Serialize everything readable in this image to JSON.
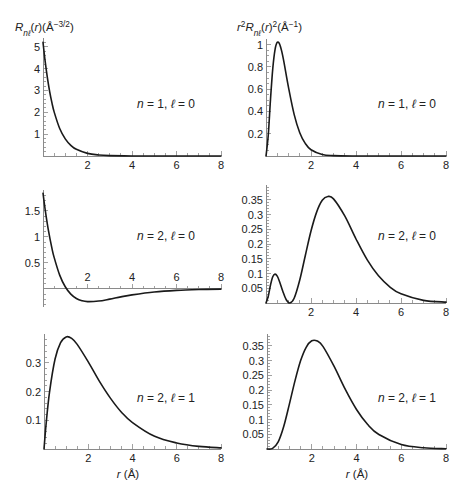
{
  "figure": {
    "left_column_ylabel": "R_nℓ(r)(Å^-3/2)",
    "right_column_ylabel": "r^2 R_nℓ(r)^2(Å^-1)",
    "xlabel": "r (Å)"
  },
  "chart_data": [
    {
      "type": "line",
      "panel": "top-left",
      "title": "",
      "ylabel": "R_nℓ(r)(Å^-3/2)",
      "ylabel_parts": [
        {
          "t": "R",
          "s": "it"
        },
        {
          "t": "nℓ",
          "s": "sub"
        },
        {
          "t": "(",
          "s": ""
        },
        {
          "t": "r",
          "s": "it"
        },
        {
          "t": ")(Å",
          "s": ""
        },
        {
          "t": "−3/2",
          "s": "sup"
        },
        {
          "t": ")",
          "s": ""
        }
      ],
      "xlabel": "",
      "annotation": "n = 1, ℓ = 0",
      "annotation_parts": [
        {
          "t": "n",
          "s": "it"
        },
        {
          "t": " = 1, ",
          "s": ""
        },
        {
          "t": "ℓ",
          "s": "it"
        },
        {
          "t": " = 0",
          "s": ""
        }
      ],
      "xlim": [
        0,
        8
      ],
      "ylim": [
        0,
        5.4
      ],
      "grid": false,
      "x_ticks": {
        "major": [
          2,
          4,
          6,
          8
        ],
        "minor_step": 0.5,
        "label_position": "below"
      },
      "y_ticks": {
        "major": [
          1,
          2,
          3,
          4,
          5
        ],
        "minor_step": 0.2
      },
      "series": [
        {
          "name": "R_10(r)",
          "x": [
            0,
            0.1,
            0.2,
            0.3,
            0.4,
            0.5,
            0.75,
            1,
            1.25,
            1.5,
            2,
            2.5,
            3,
            4,
            5,
            6,
            7,
            8
          ],
          "y": [
            5.198,
            4.303,
            3.562,
            2.948,
            2.44,
            2.02,
            1.259,
            0.785,
            0.489,
            0.305,
            0.119,
            0.046,
            0.018,
            0.003,
            0,
            0,
            0,
            0
          ]
        }
      ]
    },
    {
      "type": "line",
      "panel": "top-right",
      "title": "",
      "ylabel": "r^2 R_nℓ(r)^2(Å^-1)",
      "ylabel_parts": [
        {
          "t": "r",
          "s": "it"
        },
        {
          "t": "2",
          "s": "sup"
        },
        {
          "t": "R",
          "s": "it"
        },
        {
          "t": "nℓ",
          "s": "sub"
        },
        {
          "t": "(",
          "s": ""
        },
        {
          "t": "r",
          "s": "it"
        },
        {
          "t": ")",
          "s": ""
        },
        {
          "t": "2",
          "s": "sup"
        },
        {
          "t": "(Å",
          "s": ""
        },
        {
          "t": "−1",
          "s": "sup"
        },
        {
          "t": ")",
          "s": ""
        }
      ],
      "xlabel": "",
      "annotation": "n = 1, ℓ = 0",
      "annotation_parts": [
        {
          "t": "n",
          "s": "it"
        },
        {
          "t": " = 1, ",
          "s": ""
        },
        {
          "t": "ℓ",
          "s": "it"
        },
        {
          "t": " = 0",
          "s": ""
        }
      ],
      "xlim": [
        0,
        8
      ],
      "ylim": [
        0,
        1.05
      ],
      "grid": false,
      "x_ticks": {
        "major": [
          2,
          4,
          6,
          8
        ],
        "minor_step": 0.5,
        "label_position": "below"
      },
      "y_ticks": {
        "major": [
          0.2,
          0.4,
          0.6,
          0.8,
          1
        ],
        "minor_step": 0.05
      },
      "series": [
        {
          "name": "r^2 R_10(r)^2",
          "x": [
            0,
            0.1,
            0.2,
            0.3,
            0.4,
            0.5,
            0.6,
            0.7,
            0.8,
            1,
            1.25,
            1.5,
            1.75,
            2,
            2.5,
            3,
            4,
            5,
            6,
            7,
            8
          ],
          "y": [
            0,
            0.185,
            0.508,
            0.782,
            0.953,
            1.02,
            1.007,
            0.939,
            0.84,
            0.616,
            0.374,
            0.209,
            0.111,
            0.056,
            0.013,
            0.003,
            0,
            0,
            0,
            0,
            0
          ]
        }
      ]
    },
    {
      "type": "line",
      "panel": "middle-left",
      "title": "",
      "ylabel": "",
      "xlabel": "",
      "annotation": "n = 2, ℓ = 0",
      "annotation_parts": [
        {
          "t": "n",
          "s": "it"
        },
        {
          "t": " = 2, ",
          "s": ""
        },
        {
          "t": "ℓ",
          "s": "it"
        },
        {
          "t": " = 0",
          "s": ""
        }
      ],
      "xlim": [
        0,
        8
      ],
      "ylim": [
        -0.35,
        1.9
      ],
      "grid": false,
      "x_ticks": {
        "major": [
          2,
          4,
          6,
          8
        ],
        "minor_step": 0.5,
        "label_position": "above"
      },
      "y_ticks": {
        "major": [
          0.5,
          1,
          1.5
        ],
        "minor_step": 0.1
      },
      "series": [
        {
          "name": "R_20(r)",
          "x": [
            0,
            0.1,
            0.25,
            0.4,
            0.5,
            0.75,
            1,
            1.25,
            1.5,
            1.75,
            2,
            2.5,
            3,
            3.5,
            4,
            5,
            6,
            7,
            8
          ],
          "y": [
            1.838,
            1.514,
            1.108,
            0.783,
            0.604,
            0.263,
            0.039,
            -0.102,
            -0.186,
            -0.23,
            -0.247,
            -0.236,
            -0.198,
            -0.155,
            -0.117,
            -0.061,
            -0.03,
            -0.014,
            -0.006
          ]
        }
      ]
    },
    {
      "type": "line",
      "panel": "middle-right",
      "title": "",
      "ylabel": "",
      "xlabel": "",
      "annotation": "n = 2, ℓ = 0",
      "annotation_parts": [
        {
          "t": "n",
          "s": "it"
        },
        {
          "t": " = 2, ",
          "s": ""
        },
        {
          "t": "ℓ",
          "s": "it"
        },
        {
          "t": " = 0",
          "s": ""
        }
      ],
      "xlim": [
        0,
        8
      ],
      "ylim": [
        0,
        0.4
      ],
      "grid": false,
      "x_ticks": {
        "major": [
          2,
          4,
          6,
          8
        ],
        "minor_step": 0.5,
        "label_position": "below"
      },
      "y_ticks": {
        "major": [
          0.05,
          0.1,
          0.15,
          0.2,
          0.25,
          0.3,
          0.35
        ],
        "minor_step": 0.01
      },
      "series": [
        {
          "name": "r^2 R_20(r)^2",
          "x": [
            0,
            0.1,
            0.2,
            0.3,
            0.4,
            0.5,
            0.6,
            0.75,
            0.9,
            1.058,
            1.25,
            1.5,
            1.75,
            2,
            2.25,
            2.5,
            2.75,
            3,
            3.5,
            4,
            4.5,
            5,
            5.5,
            6,
            7,
            8
          ],
          "y": [
            0,
            0.023,
            0.061,
            0.089,
            0.098,
            0.091,
            0.073,
            0.039,
            0.011,
            0,
            0.016,
            0.078,
            0.162,
            0.244,
            0.308,
            0.348,
            0.361,
            0.353,
            0.295,
            0.217,
            0.146,
            0.092,
            0.055,
            0.031,
            0.009,
            0.003
          ]
        }
      ]
    },
    {
      "type": "line",
      "panel": "bottom-left",
      "title": "",
      "ylabel": "",
      "xlabel": "r (Å)",
      "xlabel_parts": [
        {
          "t": "r",
          "s": "it"
        },
        {
          "t": " (Å)",
          "s": ""
        }
      ],
      "annotation": "n = 2, ℓ = 1",
      "annotation_parts": [
        {
          "t": "n",
          "s": "it"
        },
        {
          "t": " = 2, ",
          "s": ""
        },
        {
          "t": "ℓ",
          "s": "it"
        },
        {
          "t": " = 1",
          "s": ""
        }
      ],
      "xlim": [
        0,
        8
      ],
      "ylim": [
        0,
        0.4
      ],
      "grid": false,
      "x_ticks": {
        "major": [
          2,
          4,
          6,
          8
        ],
        "minor_step": 0.5,
        "label_position": "below"
      },
      "y_ticks": {
        "major": [
          0.1,
          0.2,
          0.3
        ],
        "minor_step": 0.02
      },
      "series": [
        {
          "name": "R_21(r)",
          "x": [
            0,
            0.1,
            0.25,
            0.5,
            0.75,
            1,
            1.25,
            1.5,
            2,
            2.5,
            3,
            3.5,
            4,
            5,
            6,
            7,
            8
          ],
          "y": [
            0,
            0.091,
            0.198,
            0.313,
            0.37,
            0.39,
            0.385,
            0.364,
            0.303,
            0.236,
            0.177,
            0.128,
            0.092,
            0.044,
            0.021,
            0.009,
            0.004
          ]
        }
      ]
    },
    {
      "type": "line",
      "panel": "bottom-right",
      "title": "",
      "ylabel": "",
      "xlabel": "r (Å)",
      "xlabel_parts": [
        {
          "t": "r",
          "s": "it"
        },
        {
          "t": " (Å)",
          "s": ""
        }
      ],
      "annotation": "n = 2, ℓ = 1",
      "annotation_parts": [
        {
          "t": "n",
          "s": "it"
        },
        {
          "t": " = 2, ",
          "s": ""
        },
        {
          "t": "ℓ",
          "s": "it"
        },
        {
          "t": " = 1",
          "s": ""
        }
      ],
      "xlim": [
        0,
        8
      ],
      "ylim": [
        0,
        0.39
      ],
      "grid": false,
      "x_ticks": {
        "major": [
          2,
          4,
          6,
          8
        ],
        "minor_step": 0.5,
        "label_position": "below"
      },
      "y_ticks": {
        "major": [
          0.05,
          0.1,
          0.15,
          0.2,
          0.25,
          0.3,
          0.35
        ],
        "minor_step": 0.01
      },
      "series": [
        {
          "name": "r^2 R_21(r)^2",
          "x": [
            0,
            0.25,
            0.5,
            0.75,
            1,
            1.25,
            1.5,
            1.75,
            2,
            2.25,
            2.5,
            3,
            3.5,
            4,
            4.5,
            5,
            6,
            7,
            8
          ],
          "y": [
            0,
            0.002,
            0.024,
            0.077,
            0.152,
            0.231,
            0.299,
            0.345,
            0.367,
            0.366,
            0.348,
            0.28,
            0.202,
            0.134,
            0.083,
            0.049,
            0.015,
            0.004,
            0.001
          ]
        }
      ]
    }
  ]
}
